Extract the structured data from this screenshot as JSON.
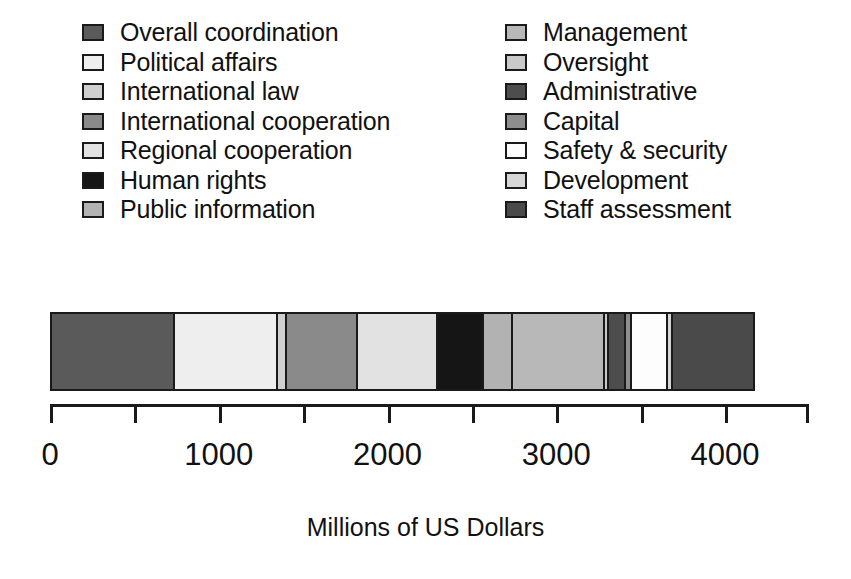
{
  "chart_data": {
    "type": "bar",
    "orientation": "horizontal",
    "stacked": true,
    "title": "",
    "xlabel": "Millions of US Dollars",
    "ylabel": "",
    "xlim": [
      0,
      4180
    ],
    "grid": false,
    "legend_position": "top",
    "axis": {
      "major_ticks": [
        0,
        1000,
        2000,
        3000,
        4000
      ],
      "major_tick_labels": [
        "0",
        "1000",
        "2000",
        "3000",
        "4000"
      ],
      "minor_ticks": [
        500,
        1500,
        2500,
        3500
      ],
      "axis_end": 4480
    },
    "categories": [
      "Overall coordination",
      "Political affairs",
      "International law",
      "International cooperation",
      "Regional cooperation",
      "Human rights",
      "Public information",
      "Management",
      "Oversight",
      "Administrative",
      "Capital",
      "Safety & security",
      "Development",
      "Staff assessment"
    ],
    "values": [
      729,
      610,
      53,
      421,
      475,
      272,
      172,
      546,
      24,
      101,
      36,
      213,
      30,
      498
    ],
    "cumulative": [
      729,
      1339,
      1392,
      1813,
      2288,
      2560,
      2732,
      3278,
      3302,
      3403,
      3439,
      3652,
      3682,
      4180
    ],
    "colors": [
      "#5a5a5a",
      "#eeeeee",
      "#cfcfcf",
      "#8a8a8a",
      "#e2e2e2",
      "#151515",
      "#b2b2b2",
      "#b8b8b8",
      "#c9c9c9",
      "#4d4d4d",
      "#8d8d8d",
      "#fdfdfd",
      "#d6d6d6",
      "#4a4a4a"
    ]
  },
  "legend": {
    "left_column": [
      {
        "label": "Overall coordination",
        "color": "#5a5a5a"
      },
      {
        "label": "Political affairs",
        "color": "#eeeeee"
      },
      {
        "label": "International law",
        "color": "#cfcfcf"
      },
      {
        "label": "International cooperation",
        "color": "#8a8a8a"
      },
      {
        "label": "Regional cooperation",
        "color": "#e2e2e2"
      },
      {
        "label": "Human rights",
        "color": "#151515"
      },
      {
        "label": "Public information",
        "color": "#b2b2b2"
      }
    ],
    "right_column": [
      {
        "label": "Management",
        "color": "#b8b8b8"
      },
      {
        "label": "Oversight",
        "color": "#c9c9c9"
      },
      {
        "label": "Administrative",
        "color": "#4d4d4d"
      },
      {
        "label": "Capital",
        "color": "#8d8d8d"
      },
      {
        "label": "Safety & security",
        "color": "#fdfdfd"
      },
      {
        "label": "Development",
        "color": "#d6d6d6"
      },
      {
        "label": "Staff assessment",
        "color": "#4a4a4a"
      }
    ]
  },
  "xlabel": "Millions of US Dollars",
  "tick_labels": [
    "0",
    "1000",
    "2000",
    "3000",
    "4000"
  ]
}
